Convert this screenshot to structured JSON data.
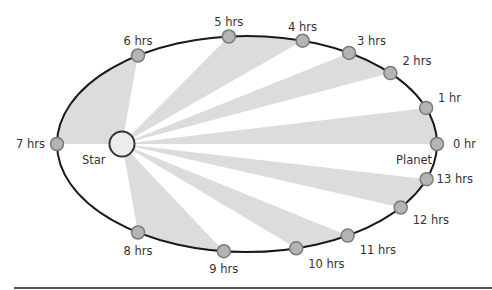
{
  "diagram": {
    "star_label": "Star",
    "planet_label": "Planet",
    "colors": {
      "orbit": "#1a1a1a",
      "wedge": "#dcdcdc",
      "marker_fill": "#b4b4b4",
      "marker_stroke": "#7a7a7a",
      "star_fill": "#ececec",
      "star_stroke": "#333333",
      "label": "#333333",
      "rule": "#555555"
    },
    "positions": [
      {
        "label": "0 hr",
        "hour": 0
      },
      {
        "label": "1 hr",
        "hour": 1
      },
      {
        "label": "2 hrs",
        "hour": 2
      },
      {
        "label": "3 hrs",
        "hour": 3
      },
      {
        "label": "4 hrs",
        "hour": 4
      },
      {
        "label": "5 hrs",
        "hour": 5
      },
      {
        "label": "6 hrs",
        "hour": 6
      },
      {
        "label": "7 hrs",
        "hour": 7
      },
      {
        "label": "8 hrs",
        "hour": 8
      },
      {
        "label": "9 hrs",
        "hour": 9
      },
      {
        "label": "10 hrs",
        "hour": 10
      },
      {
        "label": "11 hrs",
        "hour": 11
      },
      {
        "label": "12 hrs",
        "hour": 12
      },
      {
        "label": "13 hrs",
        "hour": 13
      }
    ],
    "shaded_intervals": [
      [
        0,
        1
      ],
      [
        2,
        3
      ],
      [
        4,
        5
      ],
      [
        6,
        7
      ],
      [
        8,
        9
      ],
      [
        10,
        11
      ],
      [
        12,
        13
      ]
    ]
  }
}
